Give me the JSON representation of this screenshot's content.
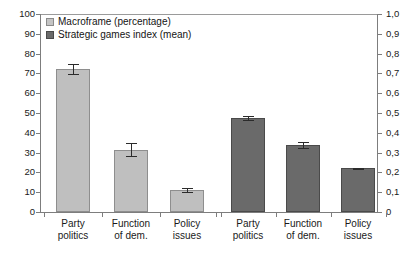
{
  "chart_data": {
    "type": "bar",
    "title": "",
    "subtitle": "",
    "xlabel": "",
    "ylabel": "",
    "grid": false,
    "legend_position": "top-left",
    "categories": [
      "Party politics",
      "Function of dem.",
      "Policy issues"
    ],
    "category_lines": [
      [
        "Party",
        "politics"
      ],
      [
        "Function",
        "of dem."
      ],
      [
        "Policy",
        "issues"
      ]
    ],
    "groups": [
      {
        "name": "Macroframe (percentage)",
        "axis": "left",
        "color": "#bfbfbf",
        "values": [
          72,
          31.5,
          11
        ],
        "errors": [
          2.5,
          3.2,
          0.9
        ]
      },
      {
        "name": "Strategic games index (mean)",
        "axis": "right",
        "color": "#6a6a6a",
        "values": [
          0.475,
          0.34,
          0.22
        ],
        "errors": [
          0.012,
          0.015,
          0.004
        ]
      }
    ],
    "left_axis": {
      "min": 0,
      "max": 100,
      "step": 10,
      "ticks": [
        "0",
        "10",
        "20",
        "30",
        "40",
        "50",
        "60",
        "70",
        "80",
        "90",
        "100"
      ]
    },
    "right_axis": {
      "min": 0,
      "max": 1.0,
      "step": 0.1,
      "ticks": [
        "0",
        "0,1",
        "0,2",
        "0,3",
        "0,4",
        "0,5",
        "0,6",
        "0,7",
        "0,8",
        "0,9",
        "1,0"
      ]
    }
  },
  "legend": {
    "items": [
      {
        "label": "Macroframe (percentage)",
        "swatch": "light"
      },
      {
        "label": "Strategic games index (mean)",
        "swatch": "dark"
      }
    ]
  }
}
